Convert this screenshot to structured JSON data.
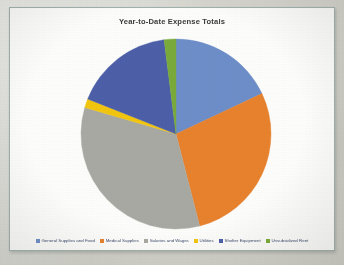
{
  "chart": {
    "title": "Year-to-Date Expense Totals"
  },
  "legend": {
    "items": [
      {
        "label": "General Supplies and Food",
        "color": "#6d8ec9"
      },
      {
        "label": "Medical Supplies",
        "color": "#e8822d"
      },
      {
        "label": "Salaries and Wages",
        "color": "#a8a9a3"
      },
      {
        "label": "Utilities",
        "color": "#f2c60f"
      },
      {
        "label": "Shelter Equipment",
        "color": "#4c5fa8"
      },
      {
        "label": "Unsubsidized Rent",
        "color": "#7aab3a"
      }
    ]
  },
  "chart_data": {
    "type": "pie",
    "title": "Year-to-Date Expense Totals",
    "xlabel": "",
    "ylabel": "",
    "legend_position": "bottom",
    "grid": false,
    "categories": [
      "General Supplies and Food",
      "Medical Supplies",
      "Salaries and Wages",
      "Utilities",
      "Shelter Equipment",
      "Unsubsidized Rent"
    ],
    "values": [
      18.0,
      28.0,
      33.5,
      1.5,
      17.0,
      2.0
    ],
    "unit": "percent",
    "colors": [
      "#6d8ec9",
      "#e8822d",
      "#a8a9a3",
      "#f2c60f",
      "#4c5fa8",
      "#7aab3a"
    ],
    "start_angle_deg": 0,
    "direction": "clockwise"
  }
}
